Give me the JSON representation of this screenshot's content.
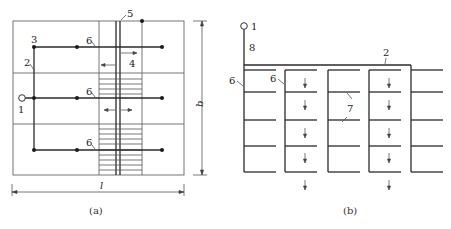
{
  "figure_a": {
    "caption": "(a)",
    "labels": {
      "source": "1",
      "main_pipe": "2",
      "junction": "3",
      "evacuation_arrow": "4",
      "stair_wall": "5",
      "branch_top": "6",
      "branch_mid": "6",
      "branch_bottom": "6"
    },
    "dimensions": {
      "width": "l",
      "height": "b"
    }
  },
  "figure_b": {
    "caption": "(b)",
    "labels": {
      "source": "1",
      "main_pipe": "2",
      "branch_left": "6",
      "branch_second": "6",
      "lateral": "7",
      "riser": "8"
    }
  },
  "colors": {
    "line": "#2a2a2a",
    "background": "#ffffff"
  }
}
